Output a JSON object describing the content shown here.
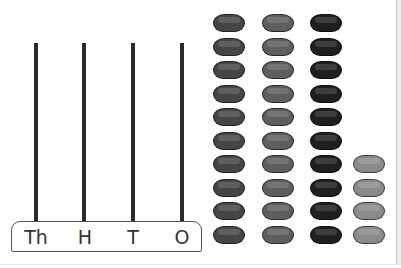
{
  "abacus": {
    "poles": [
      {
        "label": "Th",
        "x": 34
      },
      {
        "label": "H",
        "x": 82
      },
      {
        "label": "T",
        "x": 131
      },
      {
        "label": "O",
        "x": 180
      }
    ],
    "base": {
      "labels": [
        "Th",
        "H",
        "T",
        "O"
      ]
    }
  },
  "beads": {
    "columns": [
      {
        "x": 213,
        "count": 10,
        "start_y": 14,
        "color": "#454545"
      },
      {
        "x": 262,
        "count": 10,
        "start_y": 14,
        "color": "#5e5e5e"
      },
      {
        "x": 310,
        "count": 10,
        "start_y": 14,
        "color": "#1f1f1f"
      },
      {
        "x": 353,
        "count": 4,
        "start_y": 155,
        "color": "#8a8a8a"
      }
    ],
    "spacing": 23.5
  },
  "colors": {
    "pole": "#2b2b2b",
    "base_border": "#555555",
    "label": "#333333"
  }
}
